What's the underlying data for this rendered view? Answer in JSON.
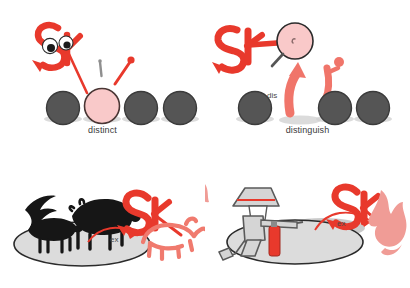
{
  "sheet": {
    "title": "Vocabulary mnemonic sheet: distinct / distinguish / extinction / fire extinguisher",
    "background": "#ffffff",
    "width": 410,
    "height": 288
  },
  "colors": {
    "brand_red": "#e8392c",
    "salmon": "#f07a6e",
    "pink_fill": "#f9c9c9",
    "circle_gray": "#555555",
    "circle_outline": "#3d3d3d",
    "shadow_gray": "#c9c9c9",
    "silhouette_black": "#1a1a1a",
    "figure_gray": "#d5d5d5",
    "figure_outline": "#555555",
    "caption_text": "#3a3a3a",
    "ground_outline": "#2b2b2b",
    "ground_fill": "#d9d9d9"
  },
  "panels": [
    {
      "id": "distinct",
      "caption": "distinct",
      "mascot": "sk-mascot",
      "mascot_letters": "SK",
      "objects": {
        "circles": [
          {
            "name": "circle-1",
            "fill": "#555555",
            "highlight": false
          },
          {
            "name": "circle-2",
            "fill": "#f9c9c9",
            "highlight": true
          },
          {
            "name": "circle-3",
            "fill": "#555555",
            "highlight": false
          },
          {
            "name": "circle-4",
            "fill": "#555555",
            "highlight": false
          }
        ],
        "pins": [
          {
            "name": "pin-gray",
            "color": "#8a8a8a"
          },
          {
            "name": "pin-red",
            "color": "#e8392c"
          }
        ]
      },
      "annotation": ""
    },
    {
      "id": "distinguish",
      "caption": "distinguish",
      "mascot": "sk-mascot",
      "mascot_letters": "SK",
      "objects": {
        "circles": [
          {
            "name": "circle-1",
            "fill": "#555555",
            "highlight": false
          },
          {
            "name": "circle-2",
            "fill": "#555555",
            "highlight": false
          },
          {
            "name": "circle-3",
            "fill": "#555555",
            "highlight": false
          }
        ],
        "magnifier": "magnifying-glass-icon",
        "magnified_circle_fill": "#f9c9c9",
        "arrow": "up-arrow-icon",
        "person": "stick-figure-icon"
      },
      "annotation": "dis"
    },
    {
      "id": "extinction",
      "caption": "extinction",
      "mascot": "sk-mascot",
      "mascot_letters": "SK",
      "objects": {
        "animals": [
          {
            "name": "bird-silhouette",
            "fill": "#1a1a1a"
          },
          {
            "name": "boar-silhouette",
            "fill": "#1a1a1a"
          },
          {
            "name": "bull-silhouette",
            "fill": "#1a1a1a"
          }
        ],
        "ejected": {
          "name": "rhino-outline",
          "fill": "#f07a6e"
        },
        "ground": "ellipse-ground",
        "arrow": "curved-arrow-out-icon"
      },
      "annotation": "ex"
    },
    {
      "id": "fire-extinguisher",
      "caption": "fire extinguisher",
      "mascot": "sk-mascot",
      "mascot_letters": "SK",
      "objects": {
        "person": {
          "name": "firefighter-figure",
          "fill": "#d5d5d5"
        },
        "helmet": {
          "name": "firefighter-helmet",
          "stripe": "#e8392c"
        },
        "tool": {
          "name": "fire-extinguisher-canister",
          "fill": "#e8392c"
        },
        "ejected": {
          "name": "flame-shape",
          "fill": "#f09c96"
        },
        "ground": "ellipse-ground",
        "arrow": "curved-arrow-out-icon"
      },
      "annotation": "ex"
    }
  ]
}
